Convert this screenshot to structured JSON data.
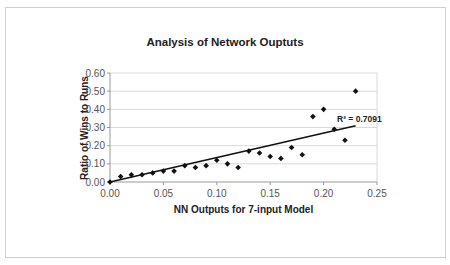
{
  "chart_data": {
    "type": "scatter",
    "title": "Analysis of Network Ouptuts",
    "xlabel": "NN Outputs for 7-input Model",
    "ylabel": "Ratio of Wins to Runs",
    "xlim": [
      0,
      0.25
    ],
    "ylim": [
      0,
      0.6
    ],
    "x_ticks": [
      "0.00",
      "0.05",
      "0.10",
      "0.15",
      "0.20",
      "0.25"
    ],
    "y_ticks": [
      "0.00",
      "0.10",
      "0.20",
      "0.30",
      "0.40",
      "0.50",
      "0.60"
    ],
    "grid": "horizontal",
    "legend": "none",
    "series": [
      {
        "name": "Data",
        "marker": "diamond",
        "x": [
          0.0,
          0.01,
          0.02,
          0.03,
          0.04,
          0.05,
          0.06,
          0.07,
          0.08,
          0.09,
          0.1,
          0.11,
          0.12,
          0.13,
          0.14,
          0.15,
          0.16,
          0.17,
          0.18,
          0.19,
          0.2,
          0.21,
          0.22,
          0.23
        ],
        "y": [
          0.0,
          0.03,
          0.04,
          0.04,
          0.05,
          0.06,
          0.06,
          0.09,
          0.08,
          0.09,
          0.12,
          0.1,
          0.08,
          0.17,
          0.16,
          0.14,
          0.13,
          0.19,
          0.15,
          0.36,
          0.4,
          0.29,
          0.23,
          0.5
        ]
      }
    ],
    "trendline": {
      "type": "linear",
      "x": [
        0.0,
        0.23
      ],
      "y": [
        0.0,
        0.31
      ],
      "r2_label": "R² = 0.7091"
    }
  }
}
